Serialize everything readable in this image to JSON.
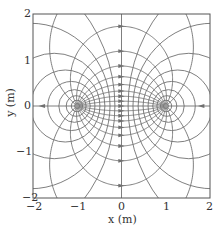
{
  "chart_data": {
    "type": "diagram",
    "title": "",
    "xlabel": "x (m)",
    "ylabel": "y (m)",
    "xlim": [
      -2,
      2
    ],
    "ylim": [
      -2,
      2
    ],
    "xticks": [
      "-2",
      "-1",
      "0",
      "1",
      "2"
    ],
    "yticks": [
      "2",
      "1",
      "0",
      "-1",
      "-2"
    ],
    "xtick_values": [
      -2,
      -1,
      0,
      1,
      2
    ],
    "ytick_values": [
      2,
      1,
      0,
      -1,
      -2
    ],
    "charges": [
      {
        "x": -1,
        "y": 0,
        "sign": "+"
      },
      {
        "x": 1,
        "y": 0,
        "sign": "-"
      }
    ],
    "field_line_count": 16,
    "equipotential_count": 8,
    "grid": false
  },
  "axes": {
    "x_label": "x (m)",
    "y_label": "y (m)",
    "x_ticks": [
      "−2",
      "−1",
      "0",
      "1",
      "2"
    ],
    "y_ticks": [
      "2",
      "1",
      "0",
      "−1",
      "−2"
    ]
  },
  "colors": {
    "line": "#707070",
    "frame": "#555555",
    "text": "#333333"
  }
}
